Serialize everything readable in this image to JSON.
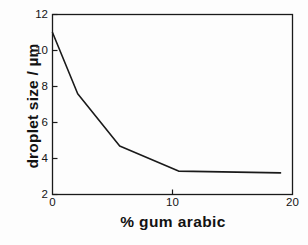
{
  "chart_data": {
    "type": "line",
    "title": "",
    "xlabel": "% gum arabic",
    "ylabel": "droplet size / µm",
    "xlim": [
      0,
      20
    ],
    "ylim": [
      2,
      12
    ],
    "xticks": [
      0,
      10,
      20
    ],
    "xtick_labels": [
      "0",
      "10",
      "20"
    ],
    "yticks": [
      2,
      4,
      6,
      8,
      10,
      12
    ],
    "ytick_labels": [
      "2",
      "4",
      "6",
      "8",
      "10",
      "12"
    ],
    "grid": false,
    "legend": null,
    "frame": "full-box",
    "tick_direction": "in",
    "series": [
      {
        "name": "droplet size",
        "color": "#1a1a1a",
        "line_width": 1.6,
        "x": [
          0.0,
          2.1,
          5.6,
          10.5,
          19.0
        ],
        "y": [
          11.0,
          7.6,
          4.7,
          3.3,
          3.2
        ]
      }
    ]
  },
  "axis": {
    "ylabel_text": "droplet size / µm",
    "xlabel_text": "% gum arabic"
  },
  "colors": {
    "line": "#1a1a1a",
    "axis": "#1a1a1a",
    "background": "#fdfdfd",
    "text": "#121212"
  }
}
